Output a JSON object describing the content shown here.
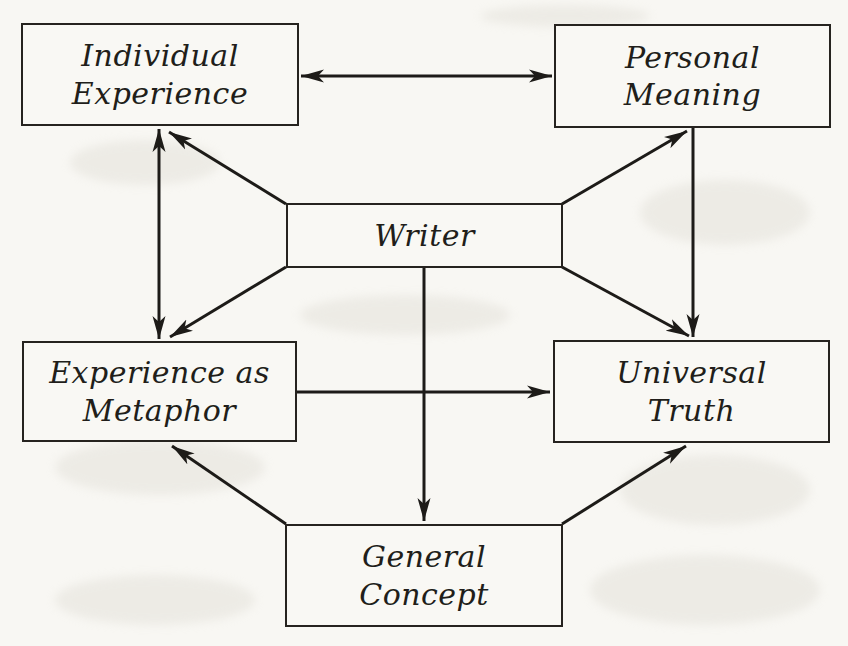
{
  "diagram": {
    "nodes": {
      "individual_experience": {
        "line1": "Individual",
        "line2": "Experience"
      },
      "personal_meaning": {
        "line1": "Personal",
        "line2": "Meaning"
      },
      "writer": {
        "label": "Writer"
      },
      "experience_as_metaphor": {
        "line1": "Experience as",
        "line2": "Metaphor"
      },
      "universal_truth": {
        "line1": "Universal",
        "line2": "Truth"
      },
      "general_concept": {
        "line1": "General",
        "line2": "Concept"
      }
    },
    "edges": [
      {
        "from": "Individual Experience",
        "to": "Personal Meaning",
        "direction": "bidirectional"
      },
      {
        "from": "Individual Experience",
        "to": "Experience as Metaphor",
        "direction": "bidirectional"
      },
      {
        "from": "Personal Meaning",
        "to": "Universal Truth",
        "direction": "one-way"
      },
      {
        "from": "Writer",
        "to": "Individual Experience",
        "direction": "one-way"
      },
      {
        "from": "Writer",
        "to": "Personal Meaning",
        "direction": "one-way"
      },
      {
        "from": "Writer",
        "to": "Experience as Metaphor",
        "direction": "one-way"
      },
      {
        "from": "Writer",
        "to": "Universal Truth",
        "direction": "one-way"
      },
      {
        "from": "Writer",
        "to": "General Concept",
        "direction": "one-way"
      },
      {
        "from": "Experience as Metaphor",
        "to": "Universal Truth",
        "direction": "one-way"
      },
      {
        "from": "General Concept",
        "to": "Experience as Metaphor",
        "direction": "one-way"
      },
      {
        "from": "General Concept",
        "to": "Universal Truth",
        "direction": "one-way"
      }
    ],
    "colors": {
      "ink": "#1d1b18",
      "paper": "#f8f7f3",
      "box_fill": "#f9f8f4"
    }
  }
}
